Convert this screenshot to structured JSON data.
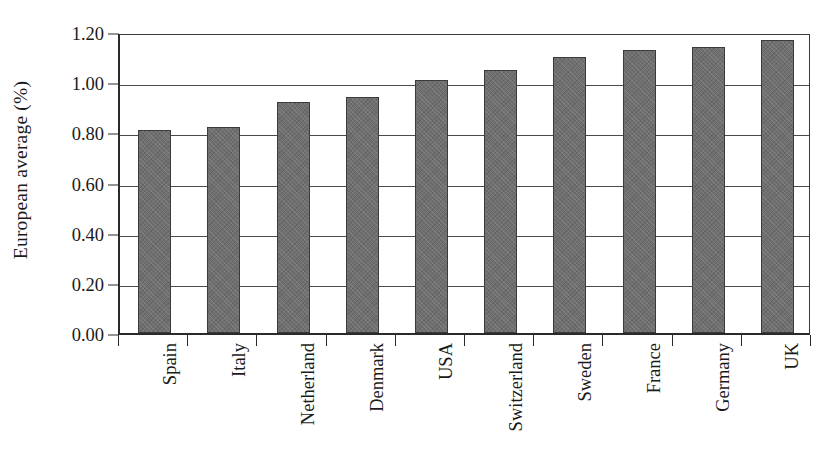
{
  "chart_data": {
    "type": "bar",
    "title": "",
    "subtitle": "",
    "xlabel": "",
    "ylabel": "European average (%)",
    "categories": [
      "Spain",
      "Italy",
      "Netherland",
      "Denmark",
      "USA",
      "Switzerland",
      "Sweden",
      "France",
      "Germany",
      "UK"
    ],
    "values": [
      0.81,
      0.82,
      0.92,
      0.94,
      1.01,
      1.05,
      1.1,
      1.13,
      1.14,
      1.17
    ],
    "ylim": [
      0.0,
      1.2
    ],
    "ytick_values": [
      0.0,
      0.2,
      0.4,
      0.6,
      0.8,
      1.0,
      1.2
    ],
    "ytick_labels": [
      "0.00",
      "0.20",
      "0.40",
      "0.60",
      "0.80",
      "1.00",
      "1.20"
    ],
    "grid": true,
    "grid_axis": "y",
    "legend": false,
    "legend_position": "none",
    "bar_color": "#6f6f6f",
    "bar_edge_color": "#3b3b3b",
    "axis_color": "#2a2a2a",
    "grid_color": "#4a4a4a",
    "background_color": "#ffffff",
    "xtick_label_rotation": 90,
    "series": [
      {
        "name": "European average",
        "values": [
          0.81,
          0.82,
          0.92,
          0.94,
          1.01,
          1.05,
          1.1,
          1.13,
          1.14,
          1.17
        ]
      }
    ]
  }
}
